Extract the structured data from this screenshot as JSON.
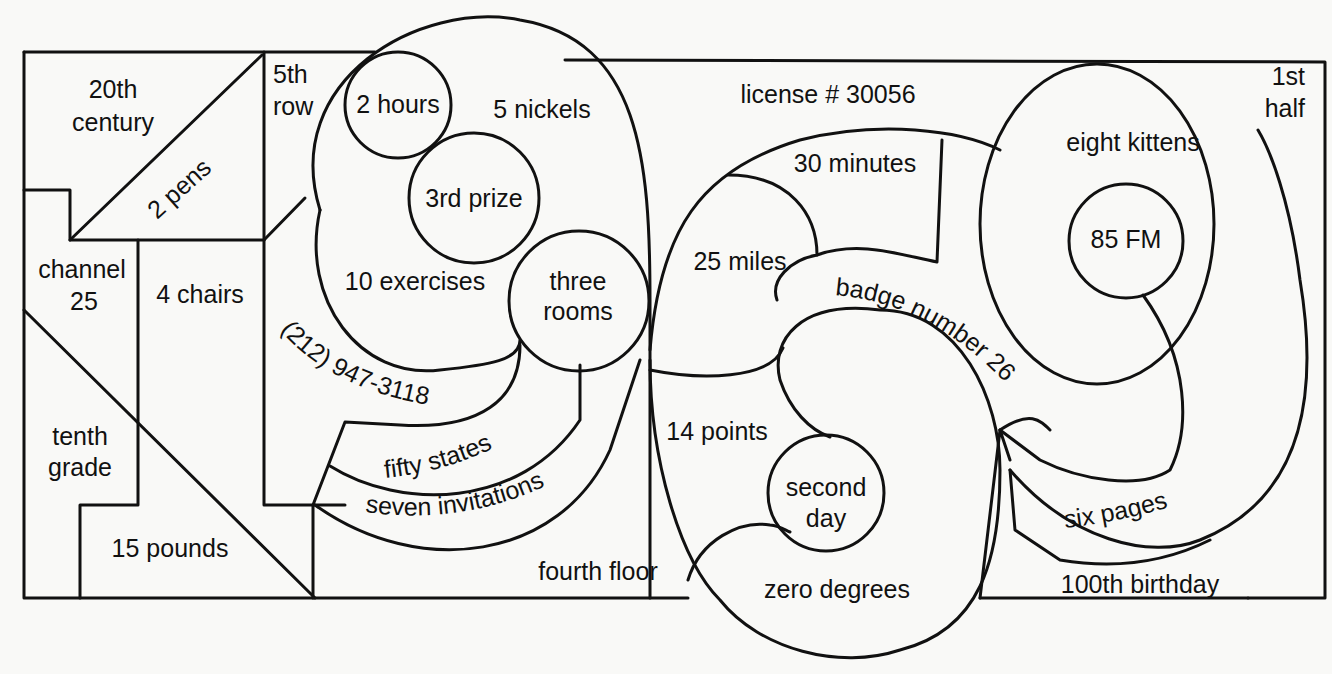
{
  "diagram": {
    "line_color": "#111111",
    "background_color": "#f9f9f7",
    "regions": [
      {
        "id": "r1",
        "label": "20th century"
      },
      {
        "id": "r2",
        "label": "2 pens"
      },
      {
        "id": "r3",
        "label": "5th row"
      },
      {
        "id": "r4",
        "label": "2 hours"
      },
      {
        "id": "r5",
        "label": "5 nickels"
      },
      {
        "id": "r6",
        "label": "license # 30056"
      },
      {
        "id": "r7",
        "label": "1st half"
      },
      {
        "id": "r8",
        "label": "eight kittens"
      },
      {
        "id": "r9",
        "label": "3rd prize"
      },
      {
        "id": "r10",
        "label": "30 minutes"
      },
      {
        "id": "r11",
        "label": "85 FM"
      },
      {
        "id": "r12",
        "label": "channel 25"
      },
      {
        "id": "r13",
        "label": "4 chairs"
      },
      {
        "id": "r14",
        "label": "10 exercises"
      },
      {
        "id": "r15",
        "label": "three rooms"
      },
      {
        "id": "r16",
        "label": "25 miles"
      },
      {
        "id": "r17",
        "label": "badge number 26"
      },
      {
        "id": "r18",
        "label": "(212) 947-3118"
      },
      {
        "id": "r19",
        "label": "tenth grade"
      },
      {
        "id": "r20",
        "label": "14 points"
      },
      {
        "id": "r21",
        "label": "fifty states"
      },
      {
        "id": "r22",
        "label": "second day"
      },
      {
        "id": "r23",
        "label": "six pages"
      },
      {
        "id": "r24",
        "label": "seven invitations"
      },
      {
        "id": "r25",
        "label": "15 pounds"
      },
      {
        "id": "r26",
        "label": "fourth floor"
      },
      {
        "id": "r27",
        "label": "zero degrees"
      },
      {
        "id": "r28",
        "label": "100th birthday"
      }
    ]
  },
  "labels": {
    "century_l1": "20th",
    "century_l2": "century",
    "pens": "2 pens",
    "row_l1": "5th",
    "row_l2": "row",
    "hours": "2 hours",
    "nickels": "5 nickels",
    "license": "license # 30056",
    "half_l1": "1st",
    "half_l2": "half",
    "kittens": "eight kittens",
    "prize": "3rd prize",
    "minutes": "30 minutes",
    "fm": "85 FM",
    "channel_l1": "channel",
    "channel_l2": "25",
    "chairs": "4 chairs",
    "exercises": "10 exercises",
    "rooms_l1": "three",
    "rooms_l2": "rooms",
    "miles": "25 miles",
    "badge": "badge number 26",
    "phone": "(212) 947-3118",
    "grade_l1": "tenth",
    "grade_l2": "grade",
    "points": "14 points",
    "states": "fifty states",
    "day_l1": "second",
    "day_l2": "day",
    "pages": "six pages",
    "invitations": "seven invitations",
    "pounds": "15 pounds",
    "floor": "fourth floor",
    "degrees": "zero degrees",
    "birthday": "100th birthday"
  }
}
